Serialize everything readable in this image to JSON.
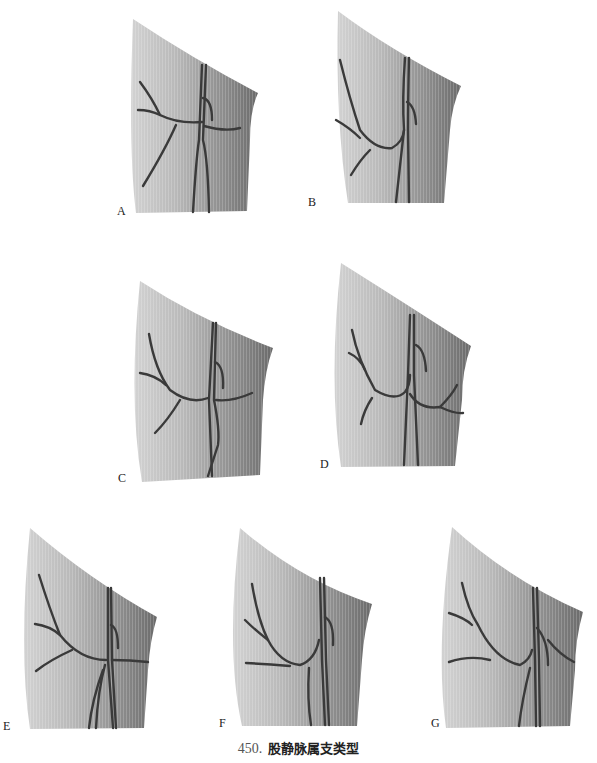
{
  "figure": {
    "caption_number": "450.",
    "caption_text": "股静脉属支类型",
    "colors": {
      "skin_light": "#c8c8c8",
      "skin_dark": "#6e6e6e",
      "vessel": "#3a3a3a",
      "background": "#ffffff"
    },
    "panels": [
      {
        "id": "A",
        "label": "A"
      },
      {
        "id": "B",
        "label": "B"
      },
      {
        "id": "C",
        "label": "C"
      },
      {
        "id": "D",
        "label": "D"
      },
      {
        "id": "E",
        "label": "E"
      },
      {
        "id": "F",
        "label": "F"
      },
      {
        "id": "G",
        "label": "G"
      }
    ]
  }
}
